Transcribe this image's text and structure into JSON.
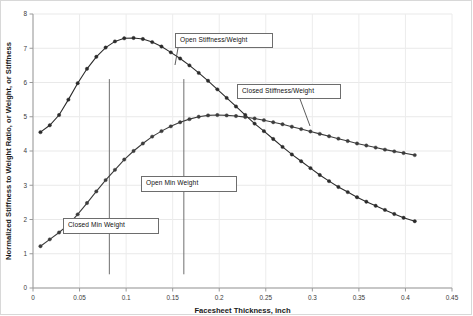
{
  "chart_data": {
    "type": "line",
    "title": "",
    "xlabel": "Facesheet Thickness, inch",
    "ylabel": "Normalized Stiffness to Weight Ratio, or Weight, or Stiffness",
    "xlim": [
      0,
      0.45
    ],
    "ylim": [
      0,
      8
    ],
    "xticks": [
      "0",
      "0.05",
      "0.1",
      "0.15",
      "0.2",
      "0.25",
      "0.3",
      "0.35",
      "0.4",
      "0.45"
    ],
    "xtick_values": [
      0,
      0.05,
      0.1,
      0.15,
      0.2,
      0.25,
      0.3,
      0.35,
      0.4,
      0.45
    ],
    "yticks": [
      "0",
      "1",
      "2",
      "3",
      "4",
      "5",
      "6",
      "7",
      "8"
    ],
    "ytick_values": [
      0,
      1,
      2,
      3,
      4,
      5,
      6,
      7,
      8
    ],
    "grid": true,
    "legend_position": "annotations",
    "marker": "circle",
    "series": [
      {
        "name": "Open Stiffness/Weight",
        "color": "#2b2b2b",
        "x": [
          0.008,
          0.018,
          0.028,
          0.038,
          0.048,
          0.058,
          0.068,
          0.078,
          0.088,
          0.098,
          0.108,
          0.118,
          0.128,
          0.138,
          0.148,
          0.158,
          0.168,
          0.178,
          0.188,
          0.198,
          0.208,
          0.218,
          0.228,
          0.238,
          0.248,
          0.258,
          0.268,
          0.278,
          0.288,
          0.298,
          0.308,
          0.318,
          0.328,
          0.338,
          0.348,
          0.358,
          0.368,
          0.378,
          0.388,
          0.398,
          0.41
        ],
        "values": [
          4.55,
          4.75,
          5.05,
          5.5,
          5.98,
          6.4,
          6.75,
          7.02,
          7.2,
          7.29,
          7.3,
          7.27,
          7.18,
          7.05,
          6.88,
          6.7,
          6.5,
          6.28,
          6.05,
          5.8,
          5.55,
          5.3,
          5.05,
          4.8,
          4.58,
          4.35,
          4.12,
          3.9,
          3.7,
          3.5,
          3.3,
          3.12,
          2.95,
          2.8,
          2.65,
          2.52,
          2.4,
          2.28,
          2.16,
          2.05,
          1.95
        ]
      },
      {
        "name": "Closed Stiffness/Weight",
        "color": "#3c3c3c",
        "x": [
          0.008,
          0.018,
          0.028,
          0.038,
          0.048,
          0.058,
          0.068,
          0.078,
          0.088,
          0.098,
          0.108,
          0.118,
          0.128,
          0.138,
          0.148,
          0.158,
          0.168,
          0.178,
          0.188,
          0.198,
          0.208,
          0.218,
          0.228,
          0.238,
          0.248,
          0.258,
          0.268,
          0.278,
          0.288,
          0.298,
          0.308,
          0.318,
          0.328,
          0.338,
          0.348,
          0.358,
          0.368,
          0.378,
          0.388,
          0.398,
          0.41
        ],
        "values": [
          1.22,
          1.42,
          1.62,
          1.85,
          2.15,
          2.48,
          2.82,
          3.15,
          3.45,
          3.75,
          4.0,
          4.22,
          4.42,
          4.58,
          4.72,
          4.84,
          4.93,
          5.0,
          5.04,
          5.05,
          5.04,
          5.02,
          4.99,
          4.95,
          4.9,
          4.84,
          4.78,
          4.71,
          4.64,
          4.57,
          4.5,
          4.43,
          4.36,
          4.29,
          4.22,
          4.16,
          4.1,
          4.04,
          3.99,
          3.94,
          3.88
        ]
      }
    ],
    "reference_lines": [
      {
        "name": "Closed Min Weight",
        "x": 0.082,
        "y_from": 0.4,
        "y_to": 6.1,
        "color": "#6f6f6f"
      },
      {
        "name": "Open Min Weight",
        "x": 0.162,
        "y_from": 0.4,
        "y_to": 6.1,
        "color": "#6f6f6f"
      }
    ],
    "annotations": [
      {
        "label": "Open Stiffness/Weight",
        "box": {
          "left": 175,
          "top": 33,
          "width": 98,
          "height": 15
        },
        "leader": {
          "x1": 178,
          "y1": 48,
          "x2": 175,
          "y2": 65
        }
      },
      {
        "label": "Closed Stiffness/Weight",
        "box": {
          "left": 237,
          "top": 84,
          "width": 104,
          "height": 15
        },
        "leader": {
          "x1": 300,
          "y1": 99,
          "x2": 310,
          "y2": 126
        }
      },
      {
        "label": "Open Min Weight",
        "box": {
          "left": 141,
          "top": 176,
          "width": 96,
          "height": 16
        },
        "leader": null
      },
      {
        "label": "Closed Min Weight",
        "box": {
          "left": 63,
          "top": 218,
          "width": 96,
          "height": 16
        },
        "leader": null
      }
    ]
  }
}
